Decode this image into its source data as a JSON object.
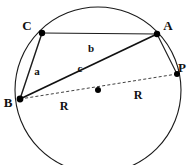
{
  "figure": {
    "type": "geometry-diagram",
    "background_color": "#ffffff",
    "stroke_color": "#1a1a1a",
    "point_color": "#000000"
  },
  "circle": {
    "center": {
      "x": 98,
      "y": 90
    },
    "radius": 83,
    "stroke_width": 1.1,
    "label": "circumcircle"
  },
  "points": [
    {
      "id": "C",
      "label": "C",
      "x": 42,
      "y": 33,
      "label_x": 27,
      "label_y": 30,
      "radius": 3.2
    },
    {
      "id": "A",
      "label": "A",
      "x": 157,
      "y": 34,
      "label_x": 165,
      "label_y": 30,
      "radius": 3.2
    },
    {
      "id": "B",
      "label": "B",
      "x": 20,
      "y": 99,
      "label_x": 5,
      "label_y": 106,
      "radius": 3.4
    },
    {
      "id": "P",
      "label": "P",
      "x": 177,
      "y": 74,
      "label_x": 179,
      "label_y": 72,
      "radius": 3.0
    },
    {
      "id": "O",
      "label": "",
      "x": 98,
      "y": 90,
      "label_x": 98,
      "label_y": 90,
      "radius": 3.0
    }
  ],
  "segments": [
    {
      "id": "CA",
      "from": "C",
      "to": "A",
      "style": "solid",
      "width": 1.0,
      "label": "b"
    },
    {
      "id": "CB",
      "from": "C",
      "to": "B",
      "style": "solid",
      "width": 1.3,
      "label": "a"
    },
    {
      "id": "BA",
      "from": "B",
      "to": "A",
      "style": "solid",
      "width": 1.6,
      "label": "c"
    },
    {
      "id": "AP",
      "from": "A",
      "to": "P",
      "style": "solid",
      "width": 1.0,
      "label": ""
    },
    {
      "id": "BP",
      "from": "B",
      "to": "P",
      "style": "dashed",
      "width": 0.9,
      "label": ""
    }
  ],
  "side_labels": [
    {
      "id": "b",
      "text": "b",
      "x": 91,
      "y": 51,
      "for": "CA"
    },
    {
      "id": "c",
      "text": "c",
      "x": 79,
      "y": 72,
      "for": "BA"
    },
    {
      "id": "a",
      "text": "a",
      "x": 37,
      "y": 74,
      "for": "CB"
    }
  ],
  "radius_labels": [
    {
      "id": "R-left",
      "text": "R",
      "x": 62,
      "y": 109,
      "for": "B-to-O"
    },
    {
      "id": "R-right",
      "text": "R",
      "x": 136,
      "y": 98,
      "for": "O-to-P"
    }
  ]
}
